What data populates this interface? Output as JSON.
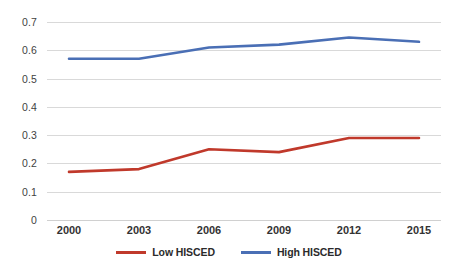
{
  "chart_data": {
    "type": "line",
    "title": "",
    "subtitle": "",
    "xlabel": "",
    "ylabel": "",
    "categories": [
      "2000",
      "2003",
      "2006",
      "2009",
      "2012",
      "2015"
    ],
    "x": [
      2000,
      2003,
      2006,
      2009,
      2012,
      2015
    ],
    "series": [
      {
        "name": "Low HISCED",
        "color": "#C0392B",
        "values": [
          0.17,
          0.18,
          0.25,
          0.24,
          0.29,
          0.29
        ]
      },
      {
        "name": "High HISCED",
        "color": "#4A6FB5",
        "values": [
          0.57,
          0.57,
          0.61,
          0.62,
          0.645,
          0.63
        ]
      }
    ],
    "ylim": [
      0,
      0.7
    ],
    "yticks": [
      "0",
      "0.1",
      "0.2",
      "0.3",
      "0.4",
      "0.5",
      "0.6",
      "0.7"
    ],
    "ytick_values": [
      0,
      0.1,
      0.2,
      0.3,
      0.4,
      0.5,
      0.6,
      0.7
    ],
    "grid": true,
    "grid_color": "#d9d9d9",
    "legend_position": "bottom",
    "background": "#FFFFFF"
  },
  "legend": {
    "items": [
      {
        "label": "Low HISCED",
        "color": "#C0392B"
      },
      {
        "label": "High HISCED",
        "color": "#4A6FB5"
      }
    ]
  }
}
